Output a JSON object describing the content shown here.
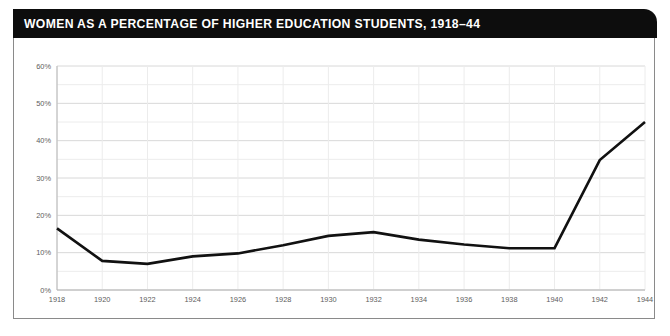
{
  "header": {
    "title": "WOMEN AS A PERCENTAGE OF HIGHER EDUCATION STUDENTS, 1918–44",
    "background_color": "#0d0d0d",
    "text_color": "#ffffff"
  },
  "chart_data": {
    "type": "line",
    "title": "WOMEN AS A PERCENTAGE OF HIGHER EDUCATION STUDENTS, 1918–44",
    "xlabel": "",
    "ylabel": "",
    "x": [
      1918,
      1920,
      1922,
      1924,
      1926,
      1928,
      1930,
      1932,
      1934,
      1936,
      1938,
      1940,
      1942,
      1944
    ],
    "values": [
      16.5,
      7.8,
      7.0,
      9.0,
      9.8,
      12.0,
      14.5,
      15.5,
      13.5,
      12.2,
      11.2,
      11.2,
      34.8,
      45.0
    ],
    "series": [
      {
        "name": "Women as a percentage of higher education students",
        "color": "#111111",
        "values": [
          16.5,
          7.8,
          7.0,
          9.0,
          9.8,
          12.0,
          14.5,
          15.5,
          13.5,
          12.2,
          11.2,
          11.2,
          34.8,
          45.0
        ]
      }
    ],
    "xlim": [
      1918,
      1944
    ],
    "ylim": [
      0,
      60
    ],
    "x_tick_labels": [
      "1918",
      "1920",
      "1922",
      "1924",
      "1926",
      "1928",
      "1930",
      "1932",
      "1934",
      "1936",
      "1938",
      "1940",
      "1942",
      "1944"
    ],
    "y_tick_labels": [
      "0%",
      "10%",
      "20%",
      "30%",
      "40%",
      "50%",
      "60%"
    ],
    "y_tick_values": [
      0,
      10,
      20,
      30,
      40,
      50,
      60
    ],
    "y_minor_tick_values": [
      5,
      15,
      25,
      35,
      45,
      55
    ],
    "grid": true,
    "grid_major_color": "#d8d8d8",
    "grid_minor_color": "#ececec",
    "legend": false,
    "legend_position": "none",
    "annotations": []
  }
}
